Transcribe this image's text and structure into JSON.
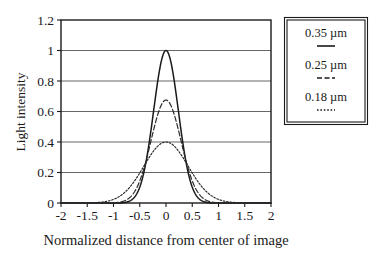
{
  "chart_data": {
    "type": "line",
    "title": "",
    "xlabel": "Normalized distance from center of image",
    "ylabel": "Light intensity",
    "xlim": [
      -2,
      2
    ],
    "ylim": [
      0,
      1.2
    ],
    "xticks": [
      "-2",
      "-1.5",
      "-1",
      "-0.5",
      "0",
      "0.5",
      "1",
      "1.5",
      "2"
    ],
    "xtick_values": [
      -2,
      -1.5,
      -1,
      -0.5,
      0,
      0.5,
      1,
      1.5,
      2
    ],
    "yticks": [
      "0",
      "0.2",
      "0.4",
      "0.6",
      "0.8",
      "1",
      "1.2"
    ],
    "ytick_values": [
      0,
      0.2,
      0.4,
      0.6,
      0.8,
      1,
      1.2
    ],
    "grid": "horizontal",
    "legend_position": "right-outside",
    "series": [
      {
        "name": "0.35 µm",
        "style": "solid",
        "color": "#1a1a1a",
        "peak": 1.0,
        "sigma": 0.235,
        "x": [
          -2,
          -1.75,
          -1.5,
          -1.25,
          -1,
          -0.9,
          -0.8,
          -0.7,
          -0.6,
          -0.5,
          -0.4,
          -0.3,
          -0.2,
          -0.1,
          0,
          0.1,
          0.2,
          0.3,
          0.4,
          0.5,
          0.6,
          0.7,
          0.8,
          0.9,
          1,
          1.25,
          1.5,
          1.75,
          2
        ],
        "values": [
          0,
          0,
          0,
          0.001,
          0.009,
          0.021,
          0.043,
          0.081,
          0.142,
          0.23,
          0.345,
          0.477,
          0.61,
          0.727,
          0.8,
          0.727,
          0.61,
          0.477,
          0.345,
          0.23,
          0.142,
          0.081,
          0.043,
          0.021,
          0.009,
          0.001,
          0,
          0,
          0
        ]
      },
      {
        "name": "0.25 µm",
        "style": "dashed",
        "color": "#2b2b2b",
        "peak": 0.675,
        "sigma": 0.285,
        "x": [
          -2,
          -1.75,
          -1.5,
          -1.25,
          -1,
          -0.9,
          -0.8,
          -0.7,
          -0.6,
          -0.5,
          -0.4,
          -0.3,
          -0.2,
          -0.1,
          0,
          0.1,
          0.2,
          0.3,
          0.4,
          0.5,
          0.6,
          0.7,
          0.8,
          0.9,
          1,
          1.25,
          1.5,
          1.75,
          2
        ],
        "values": [
          0,
          0,
          0.001,
          0.005,
          0.019,
          0.033,
          0.054,
          0.085,
          0.127,
          0.182,
          0.25,
          0.327,
          0.408,
          0.483,
          0.675,
          0.483,
          0.408,
          0.327,
          0.25,
          0.182,
          0.127,
          0.085,
          0.054,
          0.033,
          0.019,
          0.005,
          0.001,
          0,
          0
        ]
      },
      {
        "name": "0.18 µm",
        "style": "dotted",
        "color": "#2b2b2b",
        "peak": 0.4,
        "sigma": 0.42,
        "x": [
          -2,
          -1.75,
          -1.5,
          -1.25,
          -1,
          -0.9,
          -0.8,
          -0.7,
          -0.6,
          -0.5,
          -0.4,
          -0.3,
          -0.2,
          -0.1,
          0,
          0.1,
          0.2,
          0.3,
          0.4,
          0.5,
          0.6,
          0.7,
          0.8,
          0.9,
          1,
          1.25,
          1.5,
          1.75,
          2
        ],
        "values": [
          0,
          0.001,
          0.008,
          0.03,
          0.08,
          0.105,
          0.135,
          0.168,
          0.204,
          0.24,
          0.275,
          0.31,
          0.34,
          0.365,
          0.4,
          0.365,
          0.34,
          0.31,
          0.275,
          0.24,
          0.204,
          0.168,
          0.135,
          0.105,
          0.08,
          0.03,
          0.008,
          0.001,
          0
        ]
      }
    ]
  },
  "legend": {
    "entries": [
      {
        "label": "0.35 µm",
        "style": "solid"
      },
      {
        "label": "0.25 µm",
        "style": "dashed"
      },
      {
        "label": "0.18 µm",
        "style": "dotted"
      }
    ]
  },
  "colors": {
    "axis": "#1a1a1a",
    "grid": "#555555",
    "background": "#ffffff",
    "text": "#1a1a1a"
  }
}
